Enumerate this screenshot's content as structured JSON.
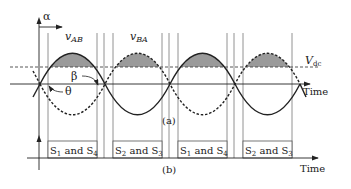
{
  "figure": {
    "axis_top_label": "α",
    "waveform_labels": {
      "vab": {
        "main": "v",
        "sub": "AB"
      },
      "vba": {
        "main": "v",
        "sub": "BA"
      }
    },
    "dc_level_label": {
      "main": "V",
      "sub": "dc"
    },
    "angle_labels": {
      "beta": "β",
      "theta": "θ"
    },
    "time_label_a": "Time",
    "time_label_b": "Time",
    "panel_a_label": "(a)",
    "panel_b_label": "(b)",
    "switch_boxes": [
      {
        "s1": "S",
        "n1": "1",
        "and": " and ",
        "s2": "S",
        "n2": "4"
      },
      {
        "s1": "S",
        "n1": "2",
        "and": " and ",
        "s2": "S",
        "n2": "3"
      },
      {
        "s1": "S",
        "n1": "1",
        "and": " and ",
        "s2": "S",
        "n2": "4"
      },
      {
        "s1": "S",
        "n1": "2",
        "and": " and ",
        "s2": "S",
        "n2": "3"
      }
    ],
    "colors": {
      "line": "#222222",
      "fill": "#9a9a9a",
      "grid": "#666666"
    }
  }
}
